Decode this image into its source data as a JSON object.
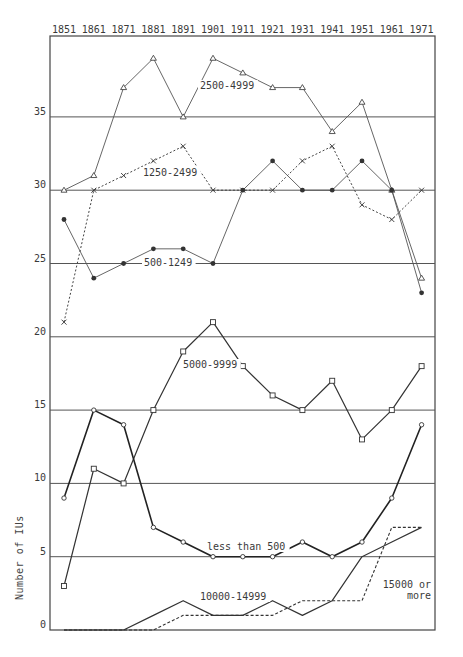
{
  "chart_data": {
    "type": "line",
    "title": "",
    "xlabel": "",
    "ylabel": "Number of IUs",
    "x": [
      1851,
      1861,
      1871,
      1881,
      1891,
      1901,
      1911,
      1921,
      1931,
      1941,
      1951,
      1961,
      1971
    ],
    "x_axis_position": "top",
    "ylim": [
      0,
      40
    ],
    "yticks": [
      0,
      5,
      10,
      15,
      20,
      25,
      30,
      35
    ],
    "grid": "horizontal at every 5 units",
    "legend": "inline labels next to series",
    "series": [
      {
        "name": "2500-4999",
        "marker": "triangle",
        "style": "solid-thin",
        "values": [
          30,
          31,
          37,
          39,
          35,
          39,
          38,
          37,
          37,
          34,
          36,
          30,
          24
        ],
        "label_pos": {
          "x": 200,
          "y": 89
        }
      },
      {
        "name": "1250-2499",
        "marker": "x",
        "style": "dotted",
        "values": [
          21,
          30,
          31,
          32,
          33,
          30,
          30,
          30,
          32,
          33,
          29,
          28,
          30
        ],
        "label_pos": {
          "x": 143,
          "y": 176
        }
      },
      {
        "name": "500-1249",
        "marker": "filled-circle",
        "style": "solid-thin",
        "values": [
          28,
          24,
          25,
          26,
          26,
          25,
          30,
          32,
          30,
          30,
          32,
          30,
          23
        ],
        "label_pos": {
          "x": 144,
          "y": 266
        }
      },
      {
        "name": "5000-9999",
        "marker": "square",
        "style": "solid",
        "values": [
          3,
          11,
          10,
          15,
          19,
          21,
          18,
          16,
          15,
          17,
          13,
          15,
          18
        ],
        "label_pos": {
          "x": 183,
          "y": 368
        }
      },
      {
        "name": "less than 500",
        "marker": "circle",
        "style": "solid-bold",
        "values": [
          9,
          15,
          14,
          7,
          6,
          5,
          5,
          5,
          6,
          5,
          6,
          9,
          14
        ],
        "label_pos": {
          "x": 207,
          "y": 550
        }
      },
      {
        "name": "10000-14999",
        "marker": "none",
        "style": "solid",
        "values": [
          0,
          0,
          0,
          1,
          2,
          1,
          1,
          2,
          1,
          2,
          5,
          6,
          7
        ],
        "label_pos": {
          "x": 200,
          "y": 600
        }
      },
      {
        "name": "15000 or more",
        "marker": "none",
        "style": "dashed",
        "values": [
          0,
          0,
          0,
          0,
          1,
          1,
          1,
          1,
          2,
          2,
          2,
          7,
          7
        ],
        "label_pos": {
          "x": 383,
          "y": 588
        },
        "label_lines": [
          "15000 or",
          "more"
        ]
      }
    ]
  }
}
